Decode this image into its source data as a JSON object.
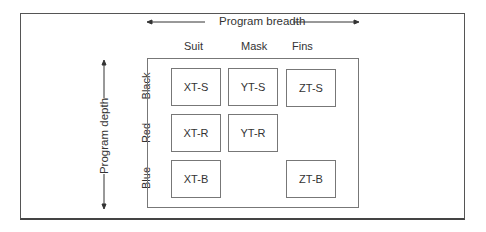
{
  "diagram": {
    "horizontal_axis": "Program breadth",
    "vertical_axis": "Program depth",
    "columns": [
      "Suit",
      "Mask",
      "Fins"
    ],
    "rows": [
      "Black",
      "Red",
      "Blue"
    ],
    "cells": {
      "black_suit": "XT-S",
      "black_mask": "YT-S",
      "black_fins": "ZT-S",
      "red_suit": "XT-R",
      "red_mask": "YT-R",
      "blue_suit": "XT-B",
      "blue_fins": "ZT-B"
    }
  }
}
